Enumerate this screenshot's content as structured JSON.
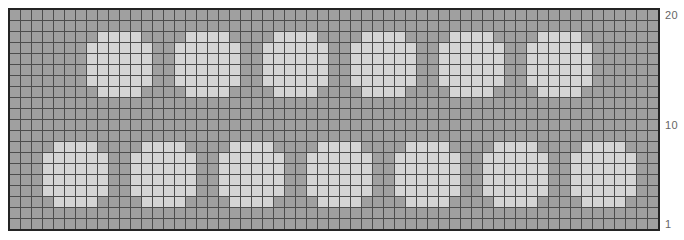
{
  "chart_data": {
    "type": "heatmap",
    "grid": {
      "columns": 59,
      "rows": 20,
      "row_numbering": "bottom-to-top"
    },
    "palette": {
      "ground_cell": "#a0a0a0",
      "dot_cell": "#d5d5d5",
      "grid_line": "#4d4d4d",
      "outer_border": "#242424",
      "label_text": "#666666",
      "page_background": "#ffffff"
    },
    "dot_shape": {
      "width": 6,
      "height": 6,
      "corner_inset": 1,
      "note": "first and last row of each dot are inset by 1 cell on each side (octagonal dot)"
    },
    "bands": [
      {
        "name": "top-band",
        "row_from_top_start": 3,
        "row_from_top_end": 8,
        "chart_rows": "18-13",
        "dot_start_columns": [
          8,
          16,
          24,
          32,
          40,
          48
        ],
        "dot_count": 6
      },
      {
        "name": "bottom-band",
        "row_from_top_start": 13,
        "row_from_top_end": 18,
        "chart_rows": "8-3",
        "dot_start_columns": [
          4,
          12,
          20,
          28,
          36,
          44,
          52
        ],
        "dot_count": 7
      }
    ],
    "row_axis_labels": [
      {
        "label": "20",
        "chart_row": 20
      },
      {
        "label": "10",
        "chart_row": 10
      },
      {
        "label": "1",
        "chart_row": 1
      }
    ],
    "legend": {
      "visible": false
    },
    "x_axis_labels": []
  }
}
